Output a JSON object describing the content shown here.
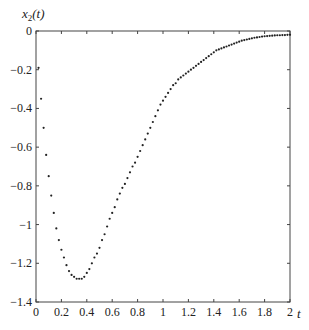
{
  "chart_data": {
    "type": "scatter",
    "title": "",
    "xlabel": "t",
    "ylabel": "x2(t)",
    "ylabel_display": {
      "base": "x",
      "subscript": "2",
      "suffix": "(t)"
    },
    "xlim": [
      0,
      2
    ],
    "ylim": [
      -1.4,
      0
    ],
    "grid": false,
    "legend": null,
    "x_ticks": [
      0,
      0.2,
      0.4,
      0.6,
      0.8,
      1,
      1.2,
      1.4,
      1.6,
      1.8,
      2
    ],
    "x_tick_labels": [
      "0",
      "0.2",
      "0.4",
      "0.6",
      "0.8",
      "1",
      "1.2",
      "1.4",
      "1.6",
      "1.8",
      "2"
    ],
    "y_ticks": [
      0,
      -0.2,
      -0.4,
      -0.6,
      -0.8,
      -1,
      -1.2,
      -1.4
    ],
    "y_tick_labels": [
      "0",
      "−0.2",
      "−0.4",
      "−0.6",
      "−0.8",
      "−1",
      "−1.2",
      "−1.4"
    ],
    "series": [
      {
        "name": "x2(t)",
        "marker": "dot",
        "color": "#222222",
        "x": [
          0.02,
          0.04,
          0.06,
          0.08,
          0.1,
          0.12,
          0.14,
          0.16,
          0.18,
          0.2,
          0.22,
          0.24,
          0.26,
          0.28,
          0.3,
          0.32,
          0.34,
          0.36,
          0.38,
          0.4,
          0.42,
          0.44,
          0.46,
          0.48,
          0.5,
          0.52,
          0.54,
          0.56,
          0.58,
          0.6,
          0.62,
          0.64,
          0.66,
          0.68,
          0.7,
          0.72,
          0.74,
          0.76,
          0.78,
          0.8,
          0.82,
          0.84,
          0.86,
          0.88,
          0.9,
          0.92,
          0.94,
          0.96,
          0.98,
          1.0,
          1.02,
          1.04,
          1.06,
          1.08,
          1.1,
          1.12,
          1.14,
          1.16,
          1.18,
          1.2,
          1.22,
          1.24,
          1.26,
          1.28,
          1.3,
          1.32,
          1.34,
          1.36,
          1.38,
          1.4,
          1.42,
          1.44,
          1.46,
          1.48,
          1.5,
          1.52,
          1.54,
          1.56,
          1.58,
          1.6,
          1.62,
          1.64,
          1.66,
          1.68,
          1.7,
          1.72,
          1.74,
          1.76,
          1.78,
          1.8,
          1.82,
          1.84,
          1.86,
          1.88,
          1.9,
          1.92,
          1.94,
          1.96,
          1.98,
          2.0
        ],
        "y": [
          -0.19,
          -0.35,
          -0.5,
          -0.64,
          -0.75,
          -0.85,
          -0.94,
          -1.02,
          -1.08,
          -1.13,
          -1.17,
          -1.21,
          -1.24,
          -1.26,
          -1.27,
          -1.28,
          -1.28,
          -1.28,
          -1.27,
          -1.25,
          -1.23,
          -1.2,
          -1.17,
          -1.15,
          -1.12,
          -1.08,
          -1.05,
          -1.01,
          -0.97,
          -0.94,
          -0.91,
          -0.87,
          -0.84,
          -0.81,
          -0.79,
          -0.76,
          -0.73,
          -0.7,
          -0.68,
          -0.65,
          -0.62,
          -0.59,
          -0.56,
          -0.53,
          -0.5,
          -0.47,
          -0.44,
          -0.41,
          -0.38,
          -0.36,
          -0.34,
          -0.32,
          -0.3,
          -0.28,
          -0.27,
          -0.25,
          -0.24,
          -0.23,
          -0.22,
          -0.21,
          -0.2,
          -0.19,
          -0.18,
          -0.17,
          -0.16,
          -0.15,
          -0.14,
          -0.13,
          -0.12,
          -0.11,
          -0.1,
          -0.095,
          -0.09,
          -0.085,
          -0.08,
          -0.075,
          -0.07,
          -0.065,
          -0.06,
          -0.055,
          -0.05,
          -0.047,
          -0.044,
          -0.041,
          -0.038,
          -0.035,
          -0.033,
          -0.031,
          -0.029,
          -0.027,
          -0.026,
          -0.025,
          -0.024,
          -0.023,
          -0.022,
          -0.022,
          -0.021,
          -0.021,
          -0.02,
          -0.02
        ]
      }
    ]
  },
  "plot_area": {
    "left": 36,
    "top": 31,
    "right": 290,
    "bottom": 302
  }
}
